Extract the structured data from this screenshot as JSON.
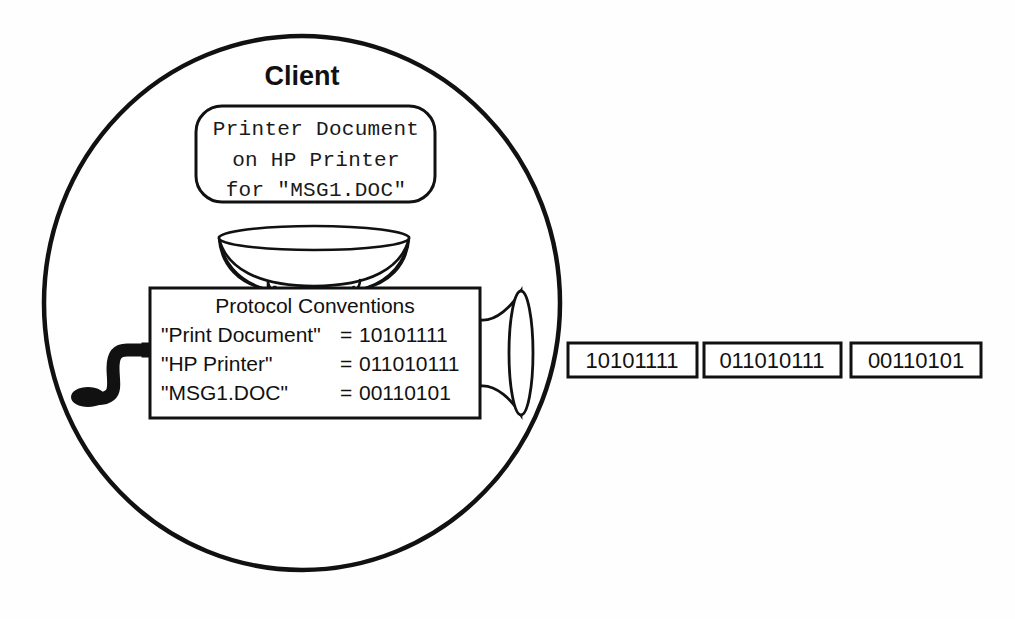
{
  "figure": {
    "title": "Client",
    "background_color": "#fefefe",
    "line_color": "#111111",
    "fill_color": "#ffffff"
  },
  "message_box": {
    "line1": "Printer Document",
    "line2": "on HP Printer",
    "line3": "for \"MSG1.DOC\""
  },
  "protocol_box": {
    "heading": "Protocol Conventions",
    "rows": [
      {
        "key": "\"Print Document\"",
        "eq": "=",
        "value": "10101111"
      },
      {
        "key": "\"HP Printer\"",
        "eq": "=",
        "value": "011010111"
      },
      {
        "key": "\"MSG1.DOC\"",
        "eq": "=",
        "value": "00110101"
      }
    ]
  },
  "output_bits": [
    {
      "value": "10101111"
    },
    {
      "value": "011010111"
    },
    {
      "value": "00110101"
    }
  ]
}
